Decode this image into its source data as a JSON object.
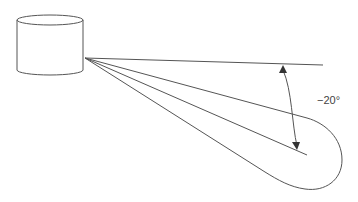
{
  "diagram": {
    "type": "sensor-beam-angle",
    "angle_label": "−20°",
    "colors": {
      "stroke": "#555555",
      "text": "#444444",
      "background": "#ffffff"
    },
    "elements": {
      "source": "cylinder",
      "beam_lines": 4,
      "beam_outline": "rounded-lobe",
      "angle_dimension": "double-arrow-arc"
    }
  }
}
